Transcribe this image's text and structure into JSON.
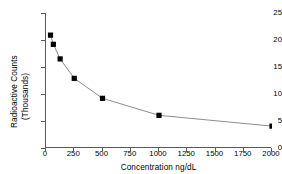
{
  "chart_data": {
    "type": "line",
    "title": "",
    "subtitle": "",
    "xlabel": "Concentration ng/dL",
    "ylabel": "Radioactive Counts",
    "ylabel_line2": "(Thousands)",
    "xlim": [
      0,
      2000
    ],
    "ylim": [
      0,
      25
    ],
    "xticks": [
      0,
      250,
      500,
      750,
      1000,
      1250,
      1500,
      1750,
      2000
    ],
    "xtick_labels": [
      "0",
      "250",
      "500",
      "750",
      "1000",
      "1250",
      "1500",
      "1750",
      "2000"
    ],
    "yticks": [
      0,
      5,
      10,
      15,
      20,
      25
    ],
    "ytick_labels": [
      "0",
      "5",
      "10",
      "15",
      "20",
      "25"
    ],
    "grid": false,
    "legend": null,
    "marker": "square",
    "marker_color": "#000000",
    "line_color": "#808080",
    "axis_color": "#5a5a5a",
    "x": [
      40,
      65,
      125,
      250,
      500,
      1000,
      2000
    ],
    "values": [
      20.9,
      19.2,
      16.5,
      12.9,
      9.2,
      6.05,
      4.05
    ],
    "series": [
      {
        "name": "Radioactive Counts",
        "points": [
          {
            "x": 40,
            "y": 20.9
          },
          {
            "x": 65,
            "y": 19.2
          },
          {
            "x": 125,
            "y": 16.5
          },
          {
            "x": 250,
            "y": 12.9
          },
          {
            "x": 500,
            "y": 9.2
          },
          {
            "x": 1000,
            "y": 6.05
          },
          {
            "x": 2000,
            "y": 4.05
          }
        ]
      }
    ]
  }
}
